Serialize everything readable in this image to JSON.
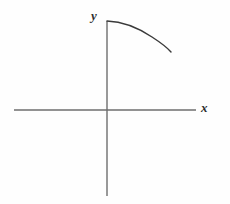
{
  "figure": {
    "name": "coordinate-axes-with-decreasing-concave-curve",
    "background_color": "#fefefe",
    "width": 230,
    "height": 204
  },
  "axes": {
    "origin": {
      "x": 107,
      "y": 110
    },
    "color": "#6e6e6e",
    "stroke_width": 1.4,
    "x_axis": {
      "label": "x",
      "label_position": {
        "x": 201,
        "y": 101
      },
      "start": {
        "x": 14,
        "y": 110
      },
      "end": {
        "x": 196,
        "y": 110
      }
    },
    "y_axis": {
      "label": "y",
      "label_position": {
        "x": 91,
        "y": 9
      },
      "start": {
        "x": 107,
        "y": 21
      },
      "end": {
        "x": 107,
        "y": 196
      }
    }
  },
  "chart_data": {
    "type": "line",
    "title": "",
    "xlabel": "x",
    "ylabel": "y",
    "grid": false,
    "legend": null,
    "curve": {
      "name": "concave-down-decreasing-curve",
      "color": "#3a3a3a",
      "stroke_width": 1.4,
      "start_point": {
        "x": 107,
        "y": 21
      },
      "end_point": {
        "x": 171,
        "y": 52
      },
      "path": "M 107 21 C 123 21.5 140 29 152 37 C 162 43.5 168 48.5 171 52",
      "points": [
        {
          "x": 107,
          "y": 21
        },
        {
          "x": 118,
          "y": 22
        },
        {
          "x": 128,
          "y": 25
        },
        {
          "x": 138,
          "y": 29
        },
        {
          "x": 148,
          "y": 35
        },
        {
          "x": 158,
          "y": 42
        },
        {
          "x": 165,
          "y": 47
        },
        {
          "x": 171,
          "y": 52
        }
      ]
    }
  }
}
